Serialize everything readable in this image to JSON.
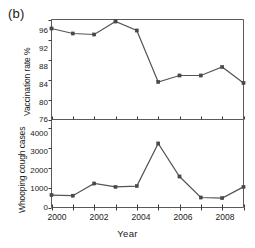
{
  "figure": {
    "panel_label": "(b)",
    "xlabel": "Year",
    "top_ylabel": "Vaccination rate %",
    "bottom_ylabel": "Whooping cough cases"
  },
  "chart_data": [
    {
      "type": "line",
      "title": "(b)",
      "panel": "top",
      "xlabel": "Year",
      "ylabel": "Vaccination rate %",
      "x": [
        2000,
        2001,
        2002,
        2003,
        2004,
        2005,
        2006,
        2007,
        2008,
        2009
      ],
      "values": [
        94.2,
        93.2,
        93.0,
        95.6,
        93.8,
        83.5,
        84.8,
        84.8,
        86.5,
        83.3
      ],
      "xlim": [
        2000,
        2009
      ],
      "ylim": [
        76,
        96
      ],
      "yticks": [
        76,
        80,
        84,
        88,
        92,
        96
      ],
      "xticks": [
        2000,
        2001,
        2002,
        2003,
        2004,
        2005,
        2006,
        2007,
        2008,
        2009
      ],
      "xtick_labels": [
        "2000",
        "",
        "2002",
        "",
        "2004",
        "",
        "2006",
        "",
        "2008",
        ""
      ],
      "grid": false,
      "legend": "none",
      "marker": "square",
      "series_color": "#555555"
    },
    {
      "type": "line",
      "panel": "bottom",
      "xlabel": "Year",
      "ylabel": "Whooping cough cases",
      "x": [
        2000,
        2001,
        2002,
        2003,
        2004,
        2005,
        2006,
        2007,
        2008,
        2009
      ],
      "values": [
        620,
        590,
        1200,
        1030,
        1070,
        3200,
        1550,
        500,
        470,
        1030
      ],
      "xlim": [
        2000,
        2009
      ],
      "ylim": [
        0,
        4400
      ],
      "yticks": [
        0,
        1000,
        2000,
        3000,
        4000
      ],
      "xticks": [
        2000,
        2001,
        2002,
        2003,
        2004,
        2005,
        2006,
        2007,
        2008,
        2009
      ],
      "xtick_labels": [
        "2000",
        "",
        "2002",
        "",
        "2004",
        "",
        "2006",
        "",
        "2008",
        ""
      ],
      "grid": false,
      "legend": "none",
      "marker": "square",
      "series_color": "#555555"
    }
  ],
  "axes": {
    "top_yticks": [
      "96",
      "92",
      "88",
      "84",
      "80",
      "76"
    ],
    "bottom_yticks": [
      "4000",
      "3000",
      "2000",
      "1000",
      "0"
    ],
    "xticks": [
      "2000",
      "2002",
      "2004",
      "2006",
      "2008"
    ]
  }
}
